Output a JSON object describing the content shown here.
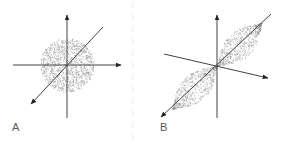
{
  "figure": {
    "panels": [
      {
        "label": "A",
        "description": "isotropic (circular) point cloud centered at origin of 3D axes",
        "cloud_shape": "circle",
        "origin": [
          67,
          65
        ],
        "cloud_radius": [
          26,
          26
        ]
      },
      {
        "label": "B",
        "description": "elongated two-lobed point cloud aligned with diagonal axis",
        "cloud_shape": "two-lobe ellipse along diagonal",
        "origin": [
          217,
          66
        ]
      }
    ],
    "colors": {
      "axis": "#444444",
      "dots": "#8a8a8a",
      "label": "#555555",
      "divider": "#ececec"
    }
  }
}
